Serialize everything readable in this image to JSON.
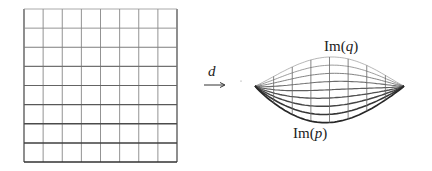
{
  "figure": {
    "map_label": "d",
    "image_top_label": {
      "prefix": "Im(",
      "var": "q",
      "suffix": ")"
    },
    "image_bottom_label": {
      "prefix": "Im(",
      "var": "p",
      "suffix": ")"
    },
    "domain_grid": {
      "columns": 8,
      "rows": 8
    },
    "image_grid": {
      "columns": 8,
      "rows": 8
    },
    "colors": {
      "line": "#333333",
      "light_line": "#8a8a8a",
      "background": "#ffffff"
    }
  }
}
